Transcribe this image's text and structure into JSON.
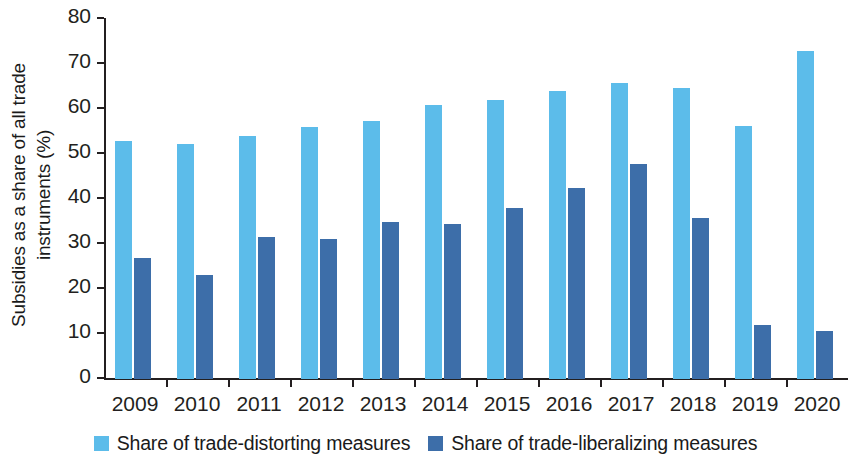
{
  "chart_data": {
    "type": "bar",
    "title": "",
    "subtitle": "",
    "xlabel": "",
    "ylabel": "Subsidies as a share of all trade instruments (%)",
    "ylabel_lines": [
      "Subsidies as a share of all trade",
      "instruments (%)"
    ],
    "categories": [
      "2009",
      "2010",
      "2011",
      "2012",
      "2013",
      "2014",
      "2015",
      "2016",
      "2017",
      "2018",
      "2019",
      "2020"
    ],
    "series": [
      {
        "name": "Share of trade-distorting measures",
        "color": "#5cbcea",
        "values": [
          52.8,
          52.2,
          54.1,
          55.9,
          57.4,
          61.0,
          61.9,
          64.1,
          65.7,
          64.6,
          56.3,
          73.0
        ]
      },
      {
        "name": "Share of trade-liberalizing measures",
        "color": "#3d6ea9",
        "values": [
          26.8,
          23.1,
          31.5,
          31.2,
          34.9,
          34.5,
          38.0,
          42.5,
          47.7,
          35.7,
          11.9,
          10.6
        ]
      }
    ],
    "yticks": [
      0,
      10,
      20,
      30,
      40,
      50,
      60,
      70,
      80
    ],
    "ylim": [
      0,
      80
    ],
    "grid": false,
    "legend_position": "bottom"
  },
  "legend": {
    "items": [
      {
        "label": "Share of trade-distorting measures",
        "color": "#5cbcea"
      },
      {
        "label": "Share of trade-liberalizing measures",
        "color": "#3d6ea9"
      }
    ]
  }
}
